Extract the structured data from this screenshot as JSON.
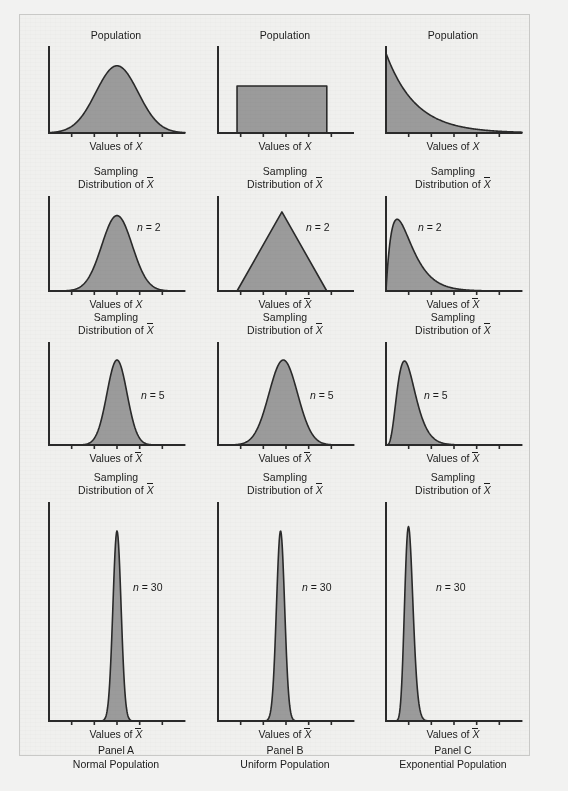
{
  "figure": {
    "background_color": "#f0f0ee",
    "frame_color": "#c9c9c7",
    "curve_fill_color": "#9b9b9b",
    "curve_stroke_color": "#2a2a2a",
    "axis_color": "#2a2a2a",
    "text_color": "#1b1b1b"
  },
  "labels": {
    "population_title": "Population",
    "sampling_title_line1": "Sampling",
    "sampling_title_line2_prefix": "Distribution of ",
    "xbar_symbol": "X",
    "values_of_x": "Values of ",
    "x_symbol": "X",
    "values_of_xbar": "Values of "
  },
  "panels": [
    {
      "id": "panel-a",
      "caption_line1": "Panel A",
      "caption_line2": "Normal Population",
      "column": 0,
      "rows": [
        {
          "row": 0,
          "title_type": "population",
          "title": "Population",
          "axis_label_kind": "x",
          "axis_label": "Values of X",
          "n_label": "",
          "dist": "normal",
          "peak_x": 0.5,
          "spread": 0.155,
          "height": 0.8
        },
        {
          "row": 1,
          "title_type": "sampling",
          "title": "Sampling Distribution of X̄",
          "axis_label_kind": "x",
          "axis_label": "Values of X",
          "n_label": "n = 2",
          "dist": "normal",
          "peak_x": 0.5,
          "spread": 0.112,
          "height": 0.82
        },
        {
          "row": 2,
          "title_type": "sampling",
          "title": "Sampling Distribution of X̄",
          "axis_label_kind": "xbar",
          "axis_label": "Values of X̄",
          "n_label": "n = 5",
          "dist": "normal",
          "peak_x": 0.5,
          "spread": 0.074,
          "height": 0.85
        },
        {
          "row": 3,
          "title_type": "sampling",
          "title": "Sampling Distribution of X̄",
          "axis_label_kind": "xbar",
          "axis_label": "Values of X̄",
          "n_label": "n = 30",
          "dist": "normal",
          "peak_x": 0.5,
          "spread": 0.03,
          "height": 0.88
        }
      ]
    },
    {
      "id": "panel-b",
      "caption_line1": "Panel B",
      "caption_line2": "Uniform Population",
      "column": 1,
      "rows": [
        {
          "row": 0,
          "title_type": "population",
          "title": "Population",
          "axis_label_kind": "x",
          "axis_label": "Values of X",
          "n_label": "",
          "dist": "uniform",
          "left_x": 0.14,
          "right_x": 0.8,
          "height": 0.56
        },
        {
          "row": 1,
          "title_type": "sampling",
          "title": "Sampling Distribution of X̄",
          "axis_label_kind": "xbar",
          "axis_label": "Values of X̄",
          "n_label": "n = 2",
          "dist": "triangular",
          "left_x": 0.14,
          "peak_x": 0.47,
          "right_x": 0.8,
          "height": 0.86
        },
        {
          "row": 2,
          "title_type": "sampling",
          "title": "Sampling Distribution of X̄",
          "axis_label_kind": "xbar",
          "axis_label": "Values of X̄",
          "n_label": "n = 5",
          "dist": "normal",
          "peak_x": 0.48,
          "spread": 0.105,
          "height": 0.85
        },
        {
          "row": 3,
          "title_type": "sampling",
          "title": "Sampling Distribution of X̄",
          "axis_label_kind": "xbar",
          "axis_label": "Values of X̄",
          "n_label": "n = 30",
          "dist": "normal",
          "peak_x": 0.46,
          "spread": 0.03,
          "height": 0.88
        }
      ]
    },
    {
      "id": "panel-c",
      "caption_line1": "Panel C",
      "caption_line2": "Exponential Population",
      "column": 2,
      "rows": [
        {
          "row": 0,
          "title_type": "population",
          "title": "Population",
          "axis_label_kind": "x",
          "axis_label": "Values of X",
          "n_label": "",
          "dist": "exponential",
          "rate": 4.6,
          "height": 0.95
        },
        {
          "row": 1,
          "title_type": "sampling",
          "title": "Sampling Distribution of X̄",
          "axis_label_kind": "xbar",
          "axis_label": "Values of X̄",
          "n_label": "n = 2",
          "dist": "gamma",
          "shape": 2,
          "scale": 0.082,
          "height": 0.78
        },
        {
          "row": 2,
          "title_type": "sampling",
          "title": "Sampling Distribution of X̄",
          "axis_label_kind": "xbar",
          "axis_label": "Values of X̄",
          "n_label": "n = 5",
          "dist": "gamma",
          "shape": 5,
          "scale": 0.034,
          "height": 0.84
        },
        {
          "row": 3,
          "title_type": "sampling",
          "title": "Sampling Distribution of X̄",
          "axis_label_kind": "xbar",
          "axis_label": "Values of X̄",
          "n_label": "n = 30",
          "dist": "gamma",
          "shape": 30,
          "scale": 0.0057,
          "height": 0.9
        }
      ]
    }
  ],
  "chart_data": {
    "type": "area",
    "xlabel": "Values of X / Values of X-bar",
    "ylabel": "",
    "grid": false,
    "legend": "none",
    "note": "Central Limit Theorem illustration: 3 population types x 4 sample sizes",
    "columns": [
      "Panel A Normal Population",
      "Panel B Uniform Population",
      "Panel C Exponential Population"
    ],
    "rows": [
      "Population",
      "n = 2",
      "n = 5",
      "n = 30"
    ],
    "series": [
      {
        "name": "Panel A - Normal Population",
        "cells": [
          {
            "row": "Population",
            "shape": "normal",
            "mean": 0.5,
            "sd": 0.155,
            "peak_height": 0.8
          },
          {
            "row": "n = 2",
            "shape": "normal",
            "mean": 0.5,
            "sd": 0.112,
            "peak_height": 0.82
          },
          {
            "row": "n = 5",
            "shape": "normal",
            "mean": 0.5,
            "sd": 0.074,
            "peak_height": 0.85
          },
          {
            "row": "n = 30",
            "shape": "normal",
            "mean": 0.5,
            "sd": 0.03,
            "peak_height": 0.88
          }
        ]
      },
      {
        "name": "Panel B - Uniform Population",
        "cells": [
          {
            "row": "Population",
            "shape": "uniform",
            "min": 0.14,
            "max": 0.8,
            "peak_height": 0.56
          },
          {
            "row": "n = 2",
            "shape": "triangular",
            "min": 0.14,
            "mode": 0.47,
            "max": 0.8,
            "peak_height": 0.86
          },
          {
            "row": "n = 5",
            "shape": "normal",
            "mean": 0.48,
            "sd": 0.105,
            "peak_height": 0.85
          },
          {
            "row": "n = 30",
            "shape": "normal",
            "mean": 0.46,
            "sd": 0.03,
            "peak_height": 0.88
          }
        ]
      },
      {
        "name": "Panel C - Exponential Population",
        "cells": [
          {
            "row": "Population",
            "shape": "exponential",
            "rate": 4.6,
            "peak_height": 0.95
          },
          {
            "row": "n = 2",
            "shape": "gamma",
            "k": 2,
            "theta": 0.082,
            "peak_height": 0.78
          },
          {
            "row": "n = 5",
            "shape": "gamma",
            "k": 5,
            "theta": 0.034,
            "peak_height": 0.84
          },
          {
            "row": "n = 30",
            "shape": "gamma",
            "k": 30,
            "theta": 0.0057,
            "peak_height": 0.9
          }
        ]
      }
    ],
    "tick_count_per_axis": 5
  }
}
